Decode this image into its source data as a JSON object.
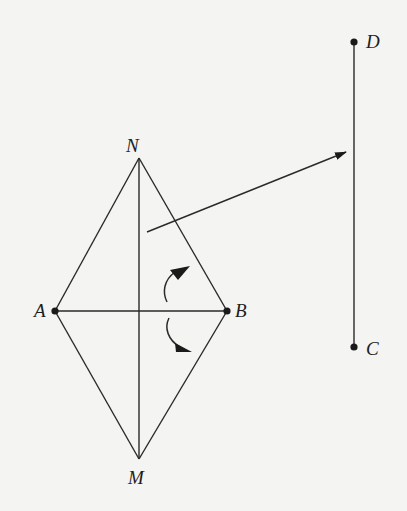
{
  "diagram": {
    "type": "geometry-figure",
    "points": {
      "N": {
        "label": "N",
        "x": 139,
        "y": 158
      },
      "A": {
        "label": "A",
        "x": 55,
        "y": 311
      },
      "B": {
        "label": "B",
        "x": 227,
        "y": 311
      },
      "M": {
        "label": "M",
        "x": 139,
        "y": 459
      },
      "D": {
        "label": "D",
        "x": 354,
        "y": 42
      },
      "C": {
        "label": "C",
        "x": 354,
        "y": 347
      }
    },
    "segments": [
      [
        "N",
        "A"
      ],
      [
        "N",
        "B"
      ],
      [
        "A",
        "M"
      ],
      [
        "B",
        "M"
      ],
      [
        "N",
        "M"
      ],
      [
        "A",
        "B"
      ],
      [
        "D",
        "C"
      ]
    ],
    "marked_points": [
      "A",
      "B",
      "D",
      "C"
    ],
    "translation_arrow": {
      "from": [
        147,
        232
      ],
      "to": [
        346,
        152
      ]
    },
    "rotation_arrows": [
      "counterclockwise-above-AB",
      "clockwise-below-AB"
    ],
    "colors": {
      "line": "#2a2a2a",
      "background": "#f4f4f2"
    }
  }
}
